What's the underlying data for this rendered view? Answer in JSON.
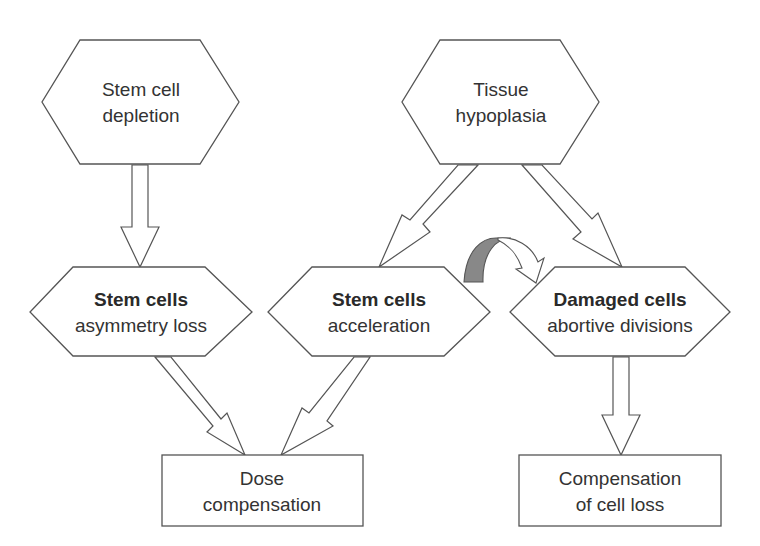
{
  "diagram": {
    "nodes": {
      "stem_cell_depletion": {
        "line1": "Stem cell",
        "line2": "depletion",
        "shape": "hexagon"
      },
      "tissue_hypoplasia": {
        "line1": "Tissue",
        "line2": "hypoplasia",
        "shape": "hexagon"
      },
      "stem_cells_asymmetry": {
        "title": "Stem cells",
        "subtitle": "asymmetry loss",
        "shape": "hexagon"
      },
      "stem_cells_acceleration": {
        "title": "Stem cells",
        "subtitle": "acceleration",
        "shape": "hexagon"
      },
      "damaged_cells": {
        "title": "Damaged cells",
        "subtitle": "abortive divisions",
        "shape": "hexagon"
      },
      "dose_compensation": {
        "line1": "Dose",
        "line2": "compensation",
        "shape": "rectangle"
      },
      "compensation_cell_loss": {
        "line1": "Compensation",
        "line2": "of cell loss",
        "shape": "rectangle"
      }
    },
    "edges": [
      {
        "from": "stem_cell_depletion",
        "to": "stem_cells_asymmetry",
        "style": "hollow-arrow"
      },
      {
        "from": "tissue_hypoplasia",
        "to": "stem_cells_acceleration",
        "style": "hollow-arrow"
      },
      {
        "from": "tissue_hypoplasia",
        "to": "damaged_cells",
        "style": "hollow-arrow"
      },
      {
        "from": "stem_cells_asymmetry",
        "to": "dose_compensation",
        "style": "hollow-arrow"
      },
      {
        "from": "stem_cells_acceleration",
        "to": "dose_compensation",
        "style": "hollow-arrow"
      },
      {
        "from": "damaged_cells",
        "to": "compensation_cell_loss",
        "style": "hollow-arrow"
      },
      {
        "from": "stem_cells_acceleration",
        "to": "damaged_cells",
        "style": "curved-arrow"
      }
    ],
    "colors": {
      "stroke": "#555555",
      "text": "#333333",
      "curved_arrow_fill": "#888888"
    }
  }
}
